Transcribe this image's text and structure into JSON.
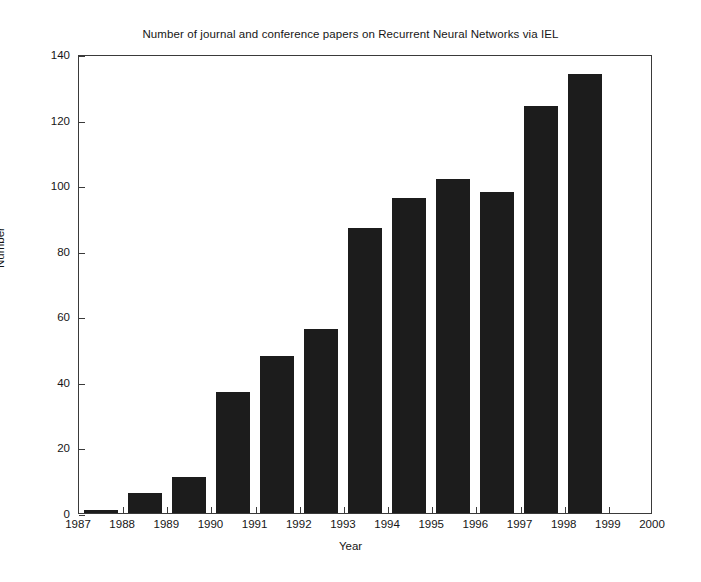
{
  "chart_data": {
    "type": "bar",
    "title": "Number of journal and conference papers on Recurrent Neural Networks via IEL",
    "xlabel": "Year",
    "ylabel": "Number",
    "categories": [
      "1987",
      "1988",
      "1989",
      "1990",
      "1991",
      "1992",
      "1993",
      "1994",
      "1995",
      "1996",
      "1997",
      "1998",
      "1999"
    ],
    "values": [
      1,
      6,
      11,
      37,
      48,
      56,
      87,
      96,
      102,
      98,
      124,
      134,
      null
    ],
    "bars": [
      {
        "year": "1987",
        "value": 1
      },
      {
        "year": "1988",
        "value": 6
      },
      {
        "year": "1989",
        "value": 11
      },
      {
        "year": "1990",
        "value": 37
      },
      {
        "year": "1991",
        "value": 48
      },
      {
        "year": "1992",
        "value": 56
      },
      {
        "year": "1993",
        "value": 87
      },
      {
        "year": "1994",
        "value": 96
      },
      {
        "year": "1995",
        "value": 102
      },
      {
        "year": "1996",
        "value": 98
      },
      {
        "year": "1997",
        "value": 124
      },
      {
        "year": "1998",
        "value": 134
      },
      {
        "year": "1999",
        "value": 0
      }
    ],
    "x_tick_labels": [
      "1987",
      "1988",
      "1989",
      "1990",
      "1991",
      "1992",
      "1993",
      "1994",
      "1995",
      "1996",
      "1997",
      "1998",
      "1999",
      "2000"
    ],
    "y_tick_labels": [
      "0",
      "20",
      "40",
      "60",
      "80",
      "100",
      "120",
      "140"
    ],
    "ylim": [
      0,
      140
    ],
    "xlim": [
      1987,
      2000
    ],
    "ytick_step": 20,
    "grid": false,
    "legend": null,
    "bar_color": "#1c1c1c",
    "axis_color": "#3a3a3a",
    "background_color": "#ffffff"
  }
}
